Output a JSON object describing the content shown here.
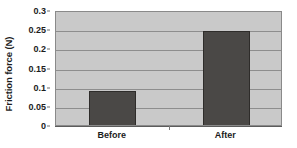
{
  "chart_data": {
    "type": "bar",
    "title": "",
    "xlabel": "",
    "ylabel": "Friction force (N)",
    "categories": [
      "Before",
      "After"
    ],
    "values": [
      0.095,
      0.25
    ],
    "ylim": [
      0,
      0.3
    ],
    "ytick_values": [
      0,
      0.05,
      0.1,
      0.15,
      0.2,
      0.25,
      0.3
    ],
    "ytick_labels": [
      "0",
      "0.05",
      "0.1",
      "0.15",
      "0.2",
      "0.25",
      "0.3"
    ],
    "grid": true,
    "grid_axis": "y",
    "legend": false,
    "legend_position": "none",
    "colors": {
      "bar_fill": "#4a4846",
      "bar_edge": "#2e2c2a",
      "plot_background": "#c9c9c9",
      "gridline": "#8d8d8d",
      "axis": "#5c5c5c",
      "text": "#1c1c1c",
      "page_background": "#ffffff"
    }
  }
}
